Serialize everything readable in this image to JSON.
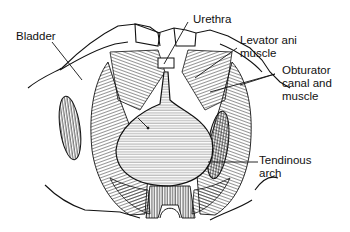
{
  "figure": {
    "type": "anatomical line drawing"
  },
  "labels": [
    {
      "id": "bladder",
      "text": "Bladder"
    },
    {
      "id": "urethra",
      "text": "Urethra"
    },
    {
      "id": "levator",
      "line1": "Levator ani",
      "line2": "muscle"
    },
    {
      "id": "obturator",
      "line1": "Obturator",
      "line2": "canal and",
      "line3": "muscle"
    },
    {
      "id": "tendinous",
      "line1": "Tendinous",
      "line2": "arch"
    }
  ],
  "colors": {
    "ink": "#111111",
    "background": "#ffffff"
  }
}
